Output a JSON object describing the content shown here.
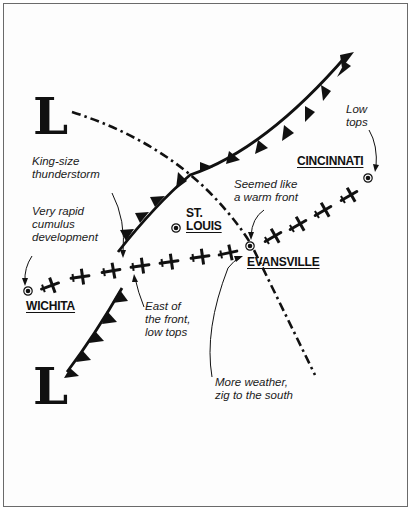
{
  "diagram": {
    "type": "weather-flight-route-map",
    "pressure_lows": [
      {
        "label": "L",
        "position": "upper-left"
      },
      {
        "label": "L",
        "position": "lower-left"
      }
    ],
    "cities": {
      "wichita": "WICHITA",
      "st_louis": "ST.\nLOUIS",
      "evansville": "EVANSVILLE",
      "cincinnati": "CINCINNATI"
    },
    "annotations": {
      "king_size": "King-size\nthunderstorm",
      "rapid_cumulus": "Very rapid\ncumulus\ndevelopment",
      "east_of_front": "East of\nthe front,\nlow tops",
      "warm_front": "Seemed like\na warm front",
      "low_tops": "Low\ntops",
      "more_weather": "More weather,\nzig to the south"
    },
    "symbols": {
      "cold_front": "triangle-pennant-line",
      "trough": "dash-dot-line",
      "aircraft": "airplane-icon",
      "city_marker": "bullseye-dot"
    },
    "colors": {
      "ink": "#111111",
      "frame": "#6a6a6a",
      "background": "#ffffff"
    }
  }
}
